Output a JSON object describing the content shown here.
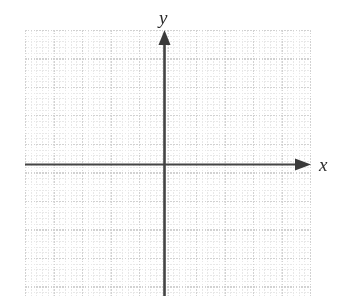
{
  "figure": {
    "kind": "blank-cartesian-grid",
    "width": 337,
    "height": 308,
    "background_color": "#ffffff"
  },
  "axes": {
    "x_label": "x",
    "y_label": "y",
    "axis_color": "#444444",
    "origin": {
      "x": 164,
      "y": 164
    },
    "x_axis": {
      "start_x": 25,
      "end_x": 311,
      "y": 164,
      "arrow": "right"
    },
    "y_axis": {
      "x": 164,
      "start_y": 296,
      "end_y": 30,
      "arrow": "up"
    }
  },
  "grid": {
    "left": 25,
    "top": 30,
    "width": 286,
    "height": 266,
    "minor_step_px": 5.7,
    "major_step_px": 28.5,
    "minor_color": "#e8e8e8",
    "major_color": "#d2d2d2",
    "minor_style": "dotted",
    "major_style": "solid"
  },
  "chart_data": {
    "type": "scatter",
    "title": "",
    "subtitle": "",
    "xlabel": "x",
    "ylabel": "y",
    "series": [
      {
        "name": "",
        "x": [],
        "y": []
      }
    ],
    "xlim": [
      -10,
      10
    ],
    "ylim": [
      -10,
      10
    ],
    "xticks": [],
    "yticks": [],
    "xticklabels": [],
    "yticklabels": [],
    "grid": true,
    "legend": false,
    "legend_position": "none",
    "annotations": [],
    "note": "Empty coordinate plane: dotted minor grid with solid major gridlines every 5 cells, arrowed x and y axes through the origin, no plotted data, no numeric tick labels."
  }
}
